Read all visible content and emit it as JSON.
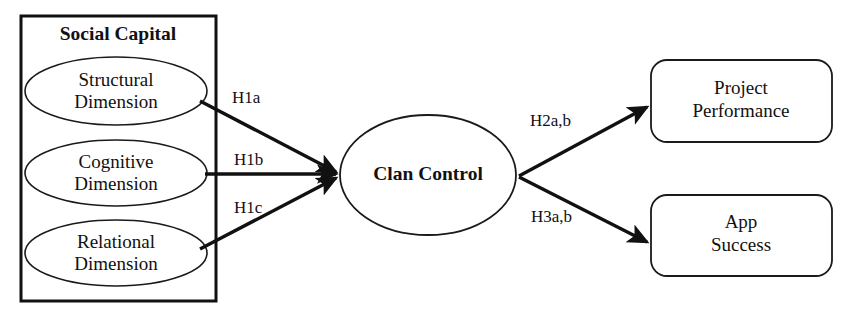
{
  "diagram": {
    "title_group": "Social Capital",
    "left_nodes": [
      {
        "line1": "Structural",
        "line2": "Dimension"
      },
      {
        "line1": "Cognitive",
        "line2": "Dimension"
      },
      {
        "line1": "Relational",
        "line2": "Dimension"
      }
    ],
    "center_node": "Clan Control",
    "right_nodes": [
      {
        "line1": "Project",
        "line2": "Performance"
      },
      {
        "line1": "App",
        "line2": "Success"
      }
    ],
    "edge_labels": {
      "h1a": "H1a",
      "h1b": "H1b",
      "h1c": "H1c",
      "h2ab": "H2a,b",
      "h3ab": "H3a,b"
    },
    "colors": {
      "stroke": "#111111",
      "fill": "#ffffff",
      "background": "#ffffff"
    }
  }
}
